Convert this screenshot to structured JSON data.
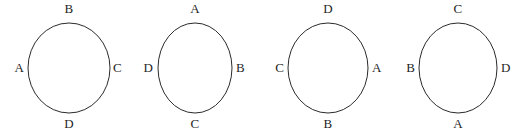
{
  "figure": {
    "name": "four-labeled-circles",
    "background_color": "#ffffff",
    "stroke_color": "#2b2b2b",
    "text_color": "#1f1f1f",
    "stroke_width": 1,
    "circle_count": 4
  },
  "circles": [
    {
      "id": "circle-1",
      "center_x": 69,
      "center_y": 68,
      "radius_x": 41,
      "radius_y": 45,
      "labels": {
        "top": "B",
        "right": "C",
        "bottom": "D",
        "left": "A"
      }
    },
    {
      "id": "circle-2",
      "center_x": 195,
      "center_y": 68,
      "radius_x": 37,
      "radius_y": 45,
      "labels": {
        "top": "A",
        "right": "B",
        "bottom": "C",
        "left": "D"
      }
    },
    {
      "id": "circle-3",
      "center_x": 328,
      "center_y": 68,
      "radius_x": 40,
      "radius_y": 45,
      "labels": {
        "top": "D",
        "right": "A",
        "bottom": "B",
        "left": "C"
      }
    },
    {
      "id": "circle-4",
      "center_x": 458,
      "center_y": 68,
      "radius_x": 39,
      "radius_y": 45,
      "labels": {
        "top": "C",
        "right": "D",
        "bottom": "A",
        "left": "B"
      }
    }
  ]
}
